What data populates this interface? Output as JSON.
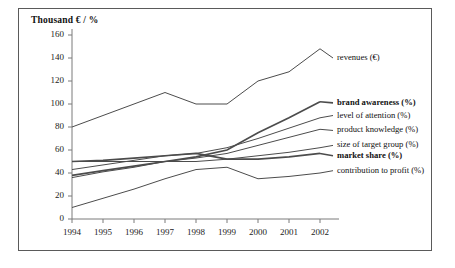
{
  "chart_data": {
    "type": "line",
    "title": "Thousand € / %",
    "xlabel": "",
    "ylabel": "Thousand € / %",
    "x": [
      1994,
      1995,
      1996,
      1997,
      1998,
      1999,
      2000,
      2001,
      2002
    ],
    "xtick_labels": [
      "1994",
      "1995",
      "1996",
      "1997",
      "1998",
      "1999",
      "2000",
      "2001",
      "2002"
    ],
    "ytick_labels": [
      "0",
      "20",
      "40",
      "60",
      "80",
      "100",
      "120",
      "140",
      "160"
    ],
    "yticks": [
      0,
      20,
      40,
      60,
      80,
      100,
      120,
      140,
      160
    ],
    "ylim": [
      0,
      160
    ],
    "xlim": [
      1994,
      2002
    ],
    "grid": false,
    "legend_position": "right-inline-labels",
    "series": [
      {
        "name": "revenues (€)",
        "bold": false,
        "label_y_value": 140,
        "values": [
          80,
          90,
          100,
          110,
          100,
          100,
          120,
          128,
          148
        ]
      },
      {
        "name": "brand awareness (%)",
        "bold": true,
        "label_y_value": 101,
        "values": [
          38,
          42,
          46,
          50,
          54,
          60,
          75,
          88,
          102
        ]
      },
      {
        "name": "level of attention (%)",
        "bold": false,
        "label_y_value": 90,
        "values": [
          43,
          47,
          51,
          55,
          57,
          62,
          70,
          79,
          88
        ]
      },
      {
        "name": "product knowledge (%)",
        "bold": false,
        "label_y_value": 77,
        "values": [
          36,
          41,
          45,
          50,
          53,
          57,
          64,
          71,
          78
        ]
      },
      {
        "name": "size of target group (%)",
        "bold": false,
        "label_y_value": 64,
        "values": [
          50,
          50,
          50,
          50,
          50,
          52,
          55,
          58,
          62
        ]
      },
      {
        "name": "market share (%)",
        "bold": true,
        "label_y_value": 55,
        "values": [
          50,
          51,
          53,
          55,
          57,
          52,
          52,
          54,
          57
        ]
      },
      {
        "name": "contribution to profit (%)",
        "bold": false,
        "label_y_value": 42,
        "values": [
          10,
          18,
          26,
          35,
          43,
          45,
          35,
          37,
          40
        ]
      }
    ]
  }
}
